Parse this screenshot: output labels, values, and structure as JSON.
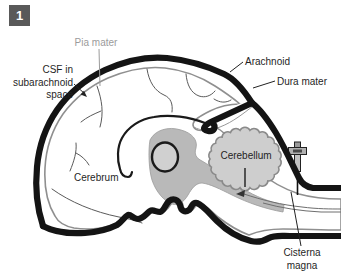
{
  "figure": {
    "badge": "1",
    "labels": {
      "pia_mater": "Pia mater",
      "csf_line1": "CSF in",
      "csf_line2": "subarachnoid",
      "csf_line3": "space",
      "arachnoid": "Arachnoid",
      "dura_mater": "Dura mater",
      "cerebrum": "Cerebrum",
      "cerebellum": "Cerebellum",
      "cisterna_magna_line1": "Cisterna",
      "cisterna_magna_line2": "magna"
    },
    "colors": {
      "background": "#ffffff",
      "brain_fill": "#d3d3d3",
      "midbrain_fill": "#b9b9b9",
      "cerebellum_fill": "#cecece",
      "ventricle_fill": "#d0d0d0",
      "wedge_fill": "#ffffff",
      "outline_gray": "#8f8f8f",
      "dura_black": "#141414",
      "pia_label_gray": "#9b9b9b",
      "label_black": "#1f1f1f",
      "badge_bg": "#595959",
      "badge_text": "#ffffff"
    }
  }
}
